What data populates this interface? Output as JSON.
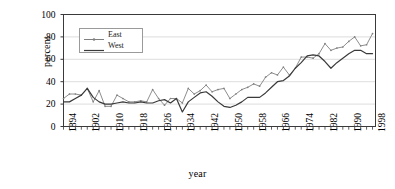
{
  "chart_data": {
    "type": "line",
    "title": "",
    "subtitle": "",
    "xlabel": "year",
    "ylabel": "percent",
    "xlim": [
      1894,
      1999
    ],
    "ylim": [
      0,
      100
    ],
    "yticks": [
      0,
      20,
      40,
      60,
      80,
      100
    ],
    "xticks": [
      1894,
      1902,
      1910,
      1918,
      1926,
      1934,
      1942,
      1950,
      1958,
      1966,
      1974,
      1982,
      1990,
      1998
    ],
    "xtick_labels": [
      "1894",
      "1902",
      "1910",
      "1918",
      "1926",
      "1934",
      "1942",
      "1950",
      "1958",
      "1966",
      "1974",
      "1982",
      "1990",
      "1998"
    ],
    "ytick_labels": [
      "0",
      "20",
      "40",
      "60",
      "80",
      "100"
    ],
    "grid": "horizontal",
    "legend_position": "upper-left-inside",
    "x_tick_interval": 2,
    "series": [
      {
        "name": "East",
        "color": "#808080",
        "marker": "dot",
        "x": [
          1894,
          1896,
          1898,
          1900,
          1902,
          1904,
          1906,
          1908,
          1910,
          1912,
          1914,
          1916,
          1918,
          1920,
          1922,
          1924,
          1926,
          1928,
          1930,
          1932,
          1934,
          1936,
          1938,
          1940,
          1942,
          1944,
          1946,
          1948,
          1950,
          1952,
          1954,
          1956,
          1958,
          1960,
          1962,
          1964,
          1966,
          1968,
          1970,
          1972,
          1974,
          1976,
          1978,
          1980,
          1982,
          1984,
          1986,
          1988,
          1990,
          1992,
          1994,
          1996,
          1998
        ],
        "values": [
          25,
          29,
          29,
          28,
          34,
          22,
          32,
          18,
          18,
          28,
          25,
          22,
          22,
          23,
          22,
          33,
          25,
          19,
          25,
          25,
          21,
          34,
          29,
          32,
          37,
          31,
          33,
          34,
          25,
          29,
          33,
          35,
          38,
          36,
          44,
          48,
          46,
          53,
          46,
          52,
          62,
          62,
          61,
          65,
          74,
          68,
          70,
          71,
          76,
          80,
          72,
          73,
          83
        ]
      },
      {
        "name": "West",
        "color": "#3a3a3a",
        "marker": "none",
        "x": [
          1894,
          1896,
          1898,
          1900,
          1902,
          1904,
          1906,
          1908,
          1910,
          1912,
          1914,
          1916,
          1918,
          1920,
          1922,
          1924,
          1926,
          1928,
          1930,
          1932,
          1934,
          1936,
          1938,
          1940,
          1942,
          1944,
          1946,
          1948,
          1950,
          1952,
          1954,
          1956,
          1958,
          1960,
          1962,
          1964,
          1966,
          1968,
          1970,
          1972,
          1974,
          1976,
          1978,
          1980,
          1982,
          1984,
          1986,
          1988,
          1990,
          1992,
          1994,
          1996,
          1998
        ],
        "values": [
          22,
          22,
          25,
          28,
          34,
          26,
          22,
          20,
          20,
          21,
          22,
          21,
          21,
          22,
          21,
          21,
          23,
          24,
          21,
          25,
          13,
          22,
          26,
          30,
          31,
          27,
          22,
          18,
          17,
          19,
          22,
          26,
          26,
          26,
          30,
          35,
          40,
          41,
          45,
          52,
          57,
          63,
          64,
          63,
          58,
          52,
          57,
          61,
          65,
          68,
          68,
          65,
          65
        ]
      }
    ]
  },
  "legend": {
    "items": [
      {
        "label": "East"
      },
      {
        "label": "West"
      }
    ]
  }
}
